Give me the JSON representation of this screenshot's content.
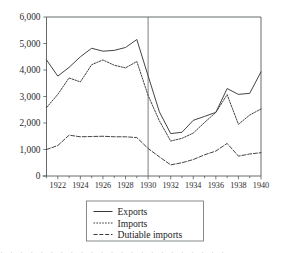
{
  "chart_data": {
    "type": "line",
    "title": "",
    "subtitle": "",
    "xlabel": "",
    "ylabel": "",
    "xlim": [
      1921,
      1940
    ],
    "ylim": [
      0,
      6000
    ],
    "grid": false,
    "legend_position": "bottom-center",
    "x": [
      1921,
      1922,
      1923,
      1924,
      1925,
      1926,
      1927,
      1928,
      1929,
      1930,
      1931,
      1932,
      1933,
      1934,
      1935,
      1936,
      1937,
      1938,
      1939,
      1940
    ],
    "y_ticks": [
      0,
      1000,
      2000,
      3000,
      4000,
      5000,
      6000
    ],
    "y_tick_labels": [
      "0",
      "1,000",
      "2,000",
      "3,000",
      "4,000",
      "5,000",
      "6,000"
    ],
    "x_ticks": [
      1922,
      1924,
      1926,
      1928,
      1930,
      1932,
      1934,
      1936,
      1938,
      1940
    ],
    "x_tick_labels": [
      "1922",
      "1924",
      "1926",
      "1928",
      "1930",
      "1932",
      "1934",
      "1936",
      "1938",
      "1940"
    ],
    "x_minor_ticks": [
      1921,
      1923,
      1925,
      1927,
      1929,
      1931,
      1933,
      1935,
      1937,
      1939
    ],
    "annotations": [
      {
        "type": "vertical-line",
        "x": 1930,
        "label": "1930"
      }
    ],
    "series": [
      {
        "name": "Exports",
        "style": "solid",
        "values": [
          4380,
          3770,
          4100,
          4500,
          4820,
          4710,
          4740,
          4850,
          5150,
          3780,
          2420,
          1600,
          1650,
          2100,
          2250,
          2400,
          3300,
          3080,
          3120,
          3930
        ]
      },
      {
        "name": "Imports",
        "style": "dotted",
        "values": [
          2580,
          3080,
          3700,
          3550,
          4200,
          4380,
          4180,
          4080,
          4320,
          3040,
          2080,
          1320,
          1420,
          1620,
          2020,
          2400,
          3070,
          1950,
          2300,
          2530
        ]
      },
      {
        "name": "Dutiable imports",
        "style": "dashed",
        "values": [
          1000,
          1150,
          1540,
          1480,
          1490,
          1500,
          1480,
          1480,
          1450,
          1040,
          720,
          420,
          500,
          620,
          800,
          940,
          1230,
          750,
          830,
          880
        ]
      }
    ]
  },
  "legend": {
    "entries": [
      {
        "label": "Exports",
        "style": "solid"
      },
      {
        "label": "Imports",
        "style": "dotted"
      },
      {
        "label": "Dutiable imports",
        "style": "dashed"
      }
    ]
  },
  "footer": {
    "partial_text": "· · · · · · · · · · · · · · · · · · · · · · ·"
  },
  "colors": {
    "line": "#3a3a3a",
    "axis": "#555b5e",
    "text": "#2b2b2b",
    "background": "#ffffff"
  }
}
